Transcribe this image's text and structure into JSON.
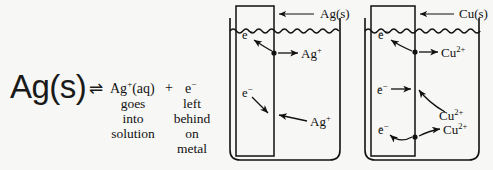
{
  "figure": {
    "background_color": "#f7f7f5",
    "ink_color": "#111111"
  },
  "equation": {
    "reactant": "Ag(s)",
    "equilibrium_arrow": "⇌",
    "product_ion": "Ag",
    "product_ion_charge": "+",
    "product_ion_state": "(aq)",
    "plus": "+",
    "product_electron": "e",
    "product_electron_charge": "−",
    "ion_annotation_lines": [
      "goes",
      "into",
      "solution"
    ],
    "electron_annotation_lines": [
      "left",
      "behind",
      "on",
      "metal"
    ]
  },
  "cells": [
    {
      "id": "silver-cell",
      "electrode_label": "Ag(s)",
      "electron_labels": [
        {
          "base": "e",
          "charge": "−"
        },
        {
          "base": "e",
          "charge": "−"
        }
      ],
      "ion_labels": [
        {
          "base": "Ag",
          "charge": "+"
        },
        {
          "base": "Ag",
          "charge": "+"
        }
      ]
    },
    {
      "id": "copper-cell",
      "electrode_label": "Cu(s)",
      "electron_labels": [
        {
          "base": "e",
          "charge": "−"
        },
        {
          "base": "e",
          "charge": "−"
        },
        {
          "base": "e",
          "charge": "−"
        }
      ],
      "ion_labels": [
        {
          "base": "Cu",
          "charge": "2+"
        },
        {
          "base": "Cu",
          "charge": "2+"
        },
        {
          "base": "Cu",
          "charge": "2+"
        }
      ]
    }
  ]
}
